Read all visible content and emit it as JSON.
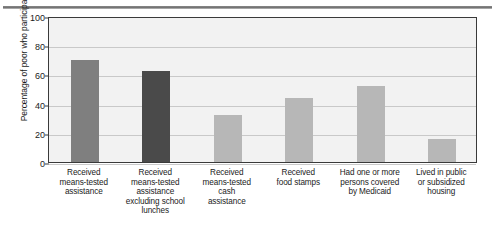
{
  "chart_data": {
    "type": "bar",
    "title": "",
    "xlabel": "",
    "ylabel": "Percentage of poor who participate",
    "ylim": [
      0,
      100
    ],
    "yticks": [
      0,
      20,
      40,
      60,
      80,
      100
    ],
    "grid": true,
    "legend": "none",
    "categories": [
      "Received means-tested assistance",
      "Received means-tested assistance excluding school lunches",
      "Received means-tested cash assistance",
      "Received food stamps",
      "Had one or more persons covered by Medicaid",
      "Lived in public or subsidized housing"
    ],
    "category_lines": [
      [
        "Received",
        "means-tested",
        "assistance"
      ],
      [
        "Received",
        "means-tested",
        "assistance",
        "excluding school",
        "lunches"
      ],
      [
        "Received",
        "means-tested",
        "cash",
        "assistance"
      ],
      [
        "Received",
        "food stamps"
      ],
      [
        "Had one or more",
        "persons covered",
        "by Medicaid"
      ],
      [
        "Lived in public",
        "or subsidized",
        "housing"
      ]
    ],
    "values": [
      70,
      62,
      32,
      44,
      52,
      16
    ],
    "bar_colors": [
      "#7f7f7f",
      "#4a4a4a",
      "#b7b7b7",
      "#b7b7b7",
      "#b7b7b7",
      "#b7b7b7"
    ]
  },
  "style": {
    "plot_background": "#f2f2f2",
    "frame_color": "#3a3a3a",
    "gridline_color": "#c9c9c9",
    "text_color": "#1b1b1b",
    "page_background": "#ffffff"
  }
}
